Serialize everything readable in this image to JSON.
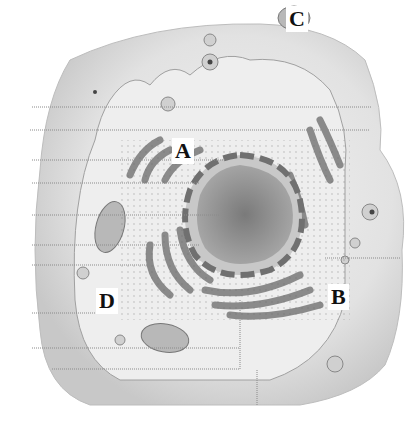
{
  "diagram": {
    "style": "grayscale halftone illustration",
    "labels": [
      {
        "id": "A",
        "text": "A",
        "points_to": "rough endoplasmic reticulum"
      },
      {
        "id": "B",
        "text": "B",
        "points_to": "golgi / vesicles region"
      },
      {
        "id": "C",
        "text": "C",
        "points_to": "mitochondrion"
      },
      {
        "id": "D",
        "text": "D",
        "points_to": "cytoplasm"
      }
    ],
    "structures": [
      "cell membrane",
      "nucleus",
      "nuclear envelope",
      "rough endoplasmic reticulum",
      "mitochondria",
      "vesicles",
      "golgi apparatus"
    ],
    "colors": {
      "background": "#ffffff",
      "cell_fill": "#e6e6e6",
      "nucleus_fill": "#8c8c8c",
      "organelle": "#9a9a9a",
      "line": "#8a8a8a",
      "label_text": "#111111"
    }
  }
}
